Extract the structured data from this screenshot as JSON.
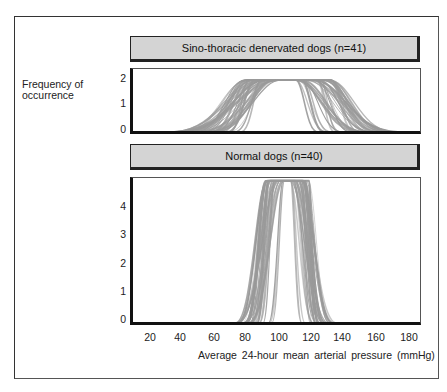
{
  "chart_data": [
    {
      "type": "line",
      "title": "Sino-thoracic denervated dogs (n=41)",
      "xlabel": "Average 24-hour mean arterial pressure (mmHg)",
      "ylabel": "Frequency of occurrence",
      "yticks": [
        0,
        1,
        2
      ],
      "ylim": [
        0,
        2.3
      ],
      "xlim": [
        10,
        190
      ],
      "xticks": [
        20,
        40,
        60,
        80,
        100,
        120,
        140,
        160,
        180
      ],
      "n_curves": 41,
      "peak_value": 1.9,
      "plateau_range": [
        78,
        132
      ],
      "spread_range": [
        30,
        175
      ],
      "line_color": "#9a9a9a"
    },
    {
      "type": "line",
      "title": "Normal dogs (n=40)",
      "xlabel": "Average 24-hour mean arterial pressure (mmHg)",
      "ylabel": "Frequency of occurrence",
      "yticks": [
        0,
        1,
        2,
        3,
        4
      ],
      "ylim": [
        0,
        5.1
      ],
      "xlim": [
        10,
        190
      ],
      "xticks": [
        20,
        40,
        60,
        80,
        100,
        120,
        140,
        160,
        180
      ],
      "n_curves": 40,
      "peak_value": 5.0,
      "plateau_range": [
        91,
        118
      ],
      "spread_range": [
        72,
        135
      ],
      "line_color": "#9a9a9a"
    }
  ],
  "labels": {
    "ytitle_line1": "Frequency of",
    "ytitle_line2": "occurrence",
    "xtitle": "Average 24-hour mean arterial pressure (mmHg)",
    "panel1_title": "Sino-thoracic denervated dogs (n=41)",
    "panel2_title": "Normal dogs (n=40)",
    "panel1_yticks": [
      "2",
      "1",
      "0"
    ],
    "panel2_yticks": [
      "4",
      "3",
      "2",
      "1",
      "0"
    ],
    "xticks": [
      "20",
      "40",
      "60",
      "80",
      "100",
      "120",
      "140",
      "160",
      "180"
    ]
  }
}
